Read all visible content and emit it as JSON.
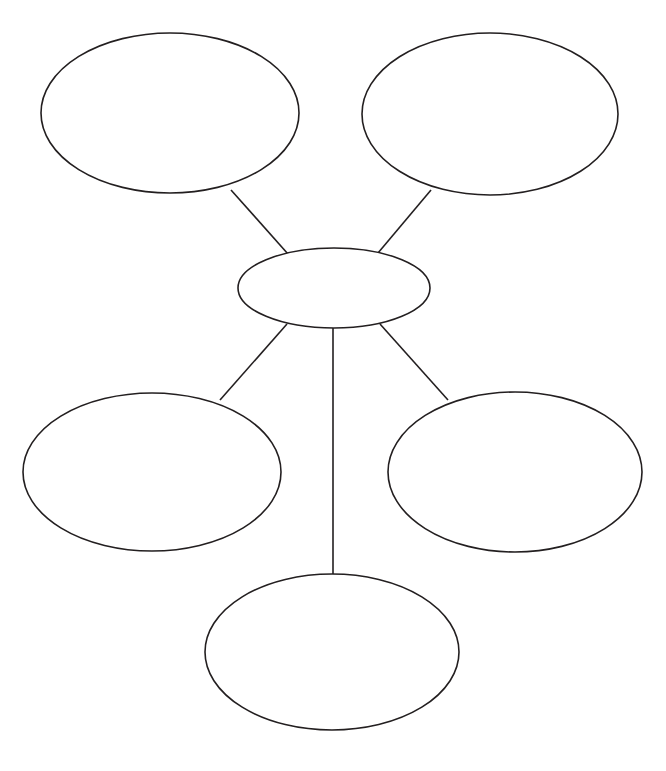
{
  "page": {
    "width": 666,
    "height": 771,
    "background_color": "#ffffff"
  },
  "style": {
    "stroke_color": "#231f20",
    "fill_color": "#ffffff",
    "node_stroke_width": 1.6,
    "connector_stroke_width": 1.6,
    "connector_color": "#231f20"
  },
  "diagram": {
    "type": "bubble-map",
    "center_node": {
      "id": "center",
      "label": "",
      "cx": 334,
      "cy": 288,
      "rx": 96,
      "ry": 40
    },
    "satellite_nodes": [
      {
        "id": "top-left",
        "label": "",
        "cx": 170,
        "cy": 113,
        "rx": 129,
        "ry": 80
      },
      {
        "id": "top-right",
        "label": "",
        "cx": 490,
        "cy": 114,
        "rx": 128,
        "ry": 81
      },
      {
        "id": "mid-left",
        "label": "",
        "cx": 152,
        "cy": 472,
        "rx": 129,
        "ry": 79
      },
      {
        "id": "mid-right",
        "label": "",
        "cx": 515,
        "cy": 472,
        "rx": 127,
        "ry": 80
      },
      {
        "id": "bottom",
        "label": "",
        "cx": 332,
        "cy": 652,
        "rx": 127,
        "ry": 78
      }
    ],
    "connectors": [
      {
        "id": "center-to-top-left",
        "from": "center",
        "to": "top-left",
        "x1": 288,
        "y1": 254,
        "x2": 231,
        "y2": 190
      },
      {
        "id": "center-to-top-right",
        "from": "center",
        "to": "top-right",
        "x1": 378,
        "y1": 253,
        "x2": 431,
        "y2": 190
      },
      {
        "id": "center-to-mid-left",
        "from": "center",
        "to": "mid-left",
        "x1": 287,
        "y1": 324,
        "x2": 220,
        "y2": 400
      },
      {
        "id": "center-to-mid-right",
        "from": "center",
        "to": "mid-right",
        "x1": 380,
        "y1": 324,
        "x2": 448,
        "y2": 400
      },
      {
        "id": "center-to-bottom",
        "from": "center",
        "to": "bottom",
        "x1": 333,
        "y1": 328,
        "x2": 333,
        "y2": 576
      }
    ]
  }
}
